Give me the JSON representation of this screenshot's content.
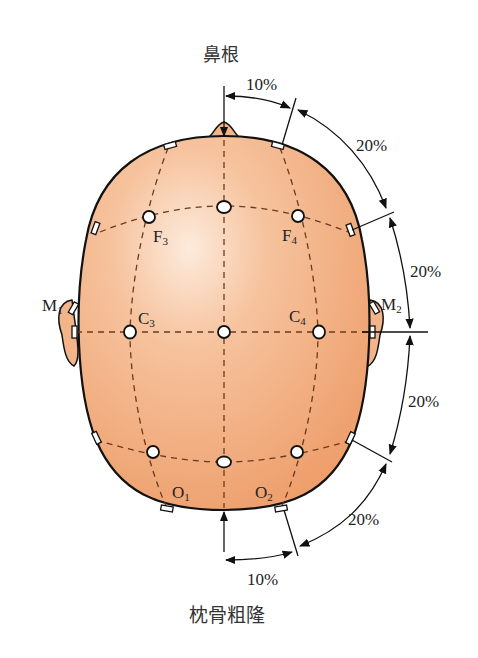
{
  "diagram": {
    "title_top": "鼻根",
    "title_bottom": "枕骨粗隆",
    "colors": {
      "skin_light": "#fbe2cc",
      "skin": "#f3b48a",
      "skin_dark": "#ec9c6a",
      "line": "#111111",
      "dash": "#6b3a1f"
    },
    "electrodes": [
      {
        "id": "F3",
        "base": "F",
        "sub": "3"
      },
      {
        "id": "F4",
        "base": "F",
        "sub": "4"
      },
      {
        "id": "C3",
        "base": "C",
        "sub": "3"
      },
      {
        "id": "C4",
        "base": "C",
        "sub": "4"
      },
      {
        "id": "O1",
        "base": "O",
        "sub": "1"
      },
      {
        "id": "O2",
        "base": "O",
        "sub": "2"
      }
    ],
    "mastoids": [
      {
        "id": "M1",
        "base": "M",
        "sub": "1"
      },
      {
        "id": "M2",
        "base": "M",
        "sub": "2"
      }
    ],
    "measurements": {
      "top_10": "10%",
      "right_20_a": "20%",
      "right_20_b": "20%",
      "right_20_c": "20%",
      "right_20_d": "20%",
      "bottom_10": "10%"
    }
  }
}
